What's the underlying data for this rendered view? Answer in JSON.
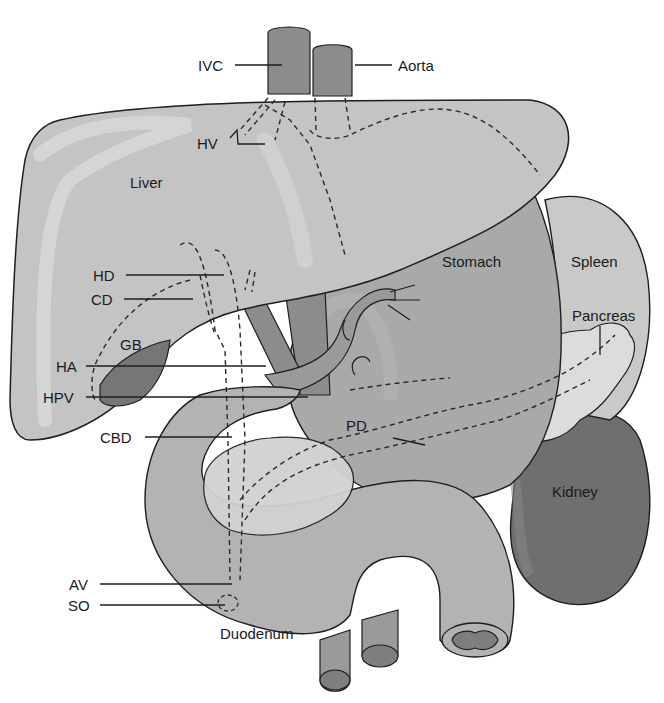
{
  "figure": {
    "colors": {
      "background": "#ffffff",
      "liver": "#c4c4c4",
      "liver_highlight": "#d9d9d9",
      "stomach": "#a9a9a9",
      "spleen": "#c9c9c9",
      "pancreas": "#dcdcdc",
      "kidney": "#6f6f6f",
      "duodenum": "#b3b3b3",
      "duodenum_inner": "#d4d4d4",
      "vessel": "#8c8c8c",
      "gallbladder": "#767676",
      "outline": "#1e1e1e",
      "label_text": "#1a1a1a"
    }
  },
  "labels": {
    "ivc": "IVC",
    "aorta": "Aorta",
    "hv": "HV",
    "liver": "Liver",
    "stomach": "Stomach",
    "spleen": "Spleen",
    "pancreas": "Pancreas",
    "hd": "HD",
    "cd": "CD",
    "gb": "GB",
    "ha": "HA",
    "hpv": "HPV",
    "cbd": "CBD",
    "pd": "PD",
    "kidney": "Kidney",
    "av": "AV",
    "so": "SO",
    "duodenum": "Duodenum"
  }
}
